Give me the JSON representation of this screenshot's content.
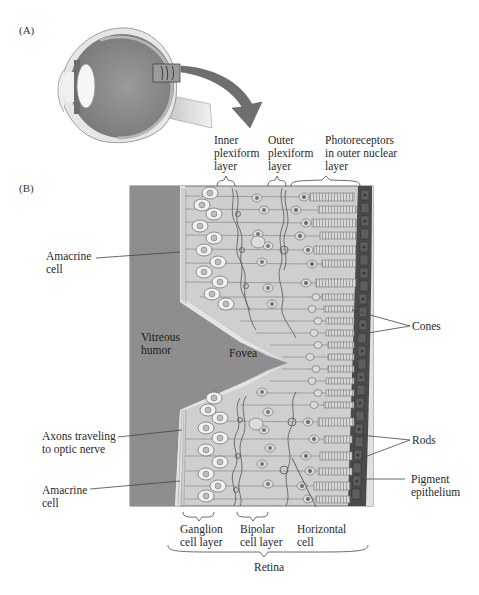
{
  "panels": {
    "a_label": "(A)",
    "b_label": "(B)"
  },
  "labels": {
    "inner_plexiform": [
      "Inner",
      "plexiform",
      "layer"
    ],
    "outer_plexiform": [
      "Outer",
      "plexiform",
      "layer"
    ],
    "photoreceptors": [
      "Photoreceptors",
      "in outer nuclear",
      "layer"
    ],
    "amacrine_top": [
      "Amacrine",
      "cell"
    ],
    "vitreous": [
      "Vitreous",
      "humor"
    ],
    "fovea": "Fovea",
    "cones": "Cones",
    "axons": [
      "Axons traveling",
      "to optic nerve"
    ],
    "amacrine_bottom": [
      "Amacrine",
      "cell"
    ],
    "rods": "Rods",
    "pigment": [
      "Pigment",
      "epithelium"
    ],
    "ganglion": [
      "Ganglion",
      "cell layer"
    ],
    "bipolar": [
      "Bipolar",
      "cell layer"
    ],
    "horizontal": [
      "Horizontal",
      "cell"
    ],
    "retina": "Retina"
  },
  "colors": {
    "vitreous": "#8e8e8e",
    "retina_bg": "#cfcfcf",
    "pigment": "#4a4a4a",
    "choroid": "#dcdcdc",
    "eye_inner": "#8a8a8a",
    "arrow": "#6e6e6e"
  }
}
